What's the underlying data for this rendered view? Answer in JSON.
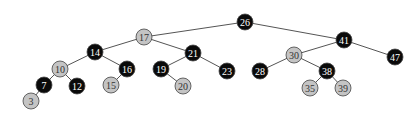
{
  "diagram": {
    "type": "red-black-tree",
    "colors": {
      "black_fill": "#0a0a0a",
      "black_text": "#ffffff",
      "red_fill": "#c4c4c4",
      "red_text": "#333333",
      "stroke": "#444444",
      "edge": "#555555"
    },
    "radius": 8,
    "nodes": [
      {
        "id": "n26",
        "label": "26",
        "color": "black",
        "x": 245,
        "y": 22
      },
      {
        "id": "n17",
        "label": "17",
        "color": "red",
        "x": 144,
        "y": 37
      },
      {
        "id": "n41",
        "label": "41",
        "color": "black",
        "x": 344,
        "y": 40
      },
      {
        "id": "n14",
        "label": "14",
        "color": "black",
        "x": 95,
        "y": 52
      },
      {
        "id": "n21",
        "label": "21",
        "color": "black",
        "x": 193,
        "y": 53
      },
      {
        "id": "n30",
        "label": "30",
        "color": "red",
        "x": 294,
        "y": 55
      },
      {
        "id": "n47",
        "label": "47",
        "color": "black",
        "x": 395,
        "y": 57
      },
      {
        "id": "n10",
        "label": "10",
        "color": "red",
        "x": 60,
        "y": 69
      },
      {
        "id": "n16",
        "label": "16",
        "color": "black",
        "x": 127,
        "y": 69
      },
      {
        "id": "n19",
        "label": "19",
        "color": "black",
        "x": 161,
        "y": 69
      },
      {
        "id": "n23",
        "label": "23",
        "color": "black",
        "x": 227,
        "y": 71
      },
      {
        "id": "n28",
        "label": "28",
        "color": "black",
        "x": 260,
        "y": 71
      },
      {
        "id": "n38",
        "label": "38",
        "color": "black",
        "x": 327,
        "y": 71
      },
      {
        "id": "n7",
        "label": "7",
        "color": "black",
        "x": 44,
        "y": 85
      },
      {
        "id": "n12",
        "label": "12",
        "color": "black",
        "x": 77,
        "y": 86
      },
      {
        "id": "n15",
        "label": "15",
        "color": "red",
        "x": 111,
        "y": 85
      },
      {
        "id": "n20",
        "label": "20",
        "color": "red",
        "x": 183,
        "y": 86
      },
      {
        "id": "n35",
        "label": "35",
        "color": "red",
        "x": 310,
        "y": 88
      },
      {
        "id": "n39",
        "label": "39",
        "color": "red",
        "x": 343,
        "y": 88
      },
      {
        "id": "n3",
        "label": "3",
        "color": "red",
        "x": 31,
        "y": 101
      }
    ],
    "edges": [
      [
        "n26",
        "n17"
      ],
      [
        "n26",
        "n41"
      ],
      [
        "n17",
        "n14"
      ],
      [
        "n17",
        "n21"
      ],
      [
        "n41",
        "n30"
      ],
      [
        "n41",
        "n47"
      ],
      [
        "n14",
        "n10"
      ],
      [
        "n14",
        "n16"
      ],
      [
        "n21",
        "n19"
      ],
      [
        "n21",
        "n23"
      ],
      [
        "n30",
        "n28"
      ],
      [
        "n30",
        "n38"
      ],
      [
        "n10",
        "n7"
      ],
      [
        "n10",
        "n12"
      ],
      [
        "n16",
        "n15"
      ],
      [
        "n19",
        "n20"
      ],
      [
        "n38",
        "n35"
      ],
      [
        "n38",
        "n39"
      ],
      [
        "n7",
        "n3"
      ]
    ]
  }
}
